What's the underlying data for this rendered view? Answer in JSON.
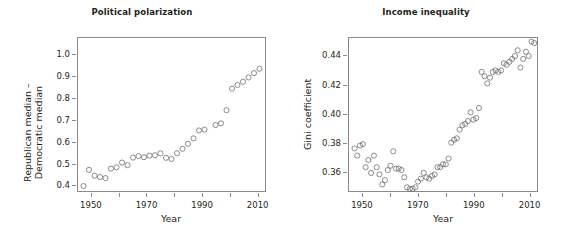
{
  "figure": {
    "background": "#ffffff",
    "point_color": "#6f6f6f",
    "axis_color": "#8a8a8a",
    "text_color": "#231f20"
  },
  "chart_data": [
    {
      "type": "scatter",
      "title": "Political polarization",
      "xlabel": "Year",
      "ylabel": "Republican median –\nDemocratic median",
      "ylabel_line1": "Republican median –",
      "ylabel_line2": "Democratic median",
      "xlim": [
        1945,
        2013
      ],
      "ylim": [
        0.37,
        1.08
      ],
      "xticks": [
        1950,
        1970,
        1990,
        2010
      ],
      "xtick_labels": [
        "1950",
        "1970",
        "1990",
        "2010"
      ],
      "xminor_ticks": [
        1960,
        1980,
        2000
      ],
      "yticks": [
        0.4,
        0.5,
        0.6,
        0.7,
        0.8,
        0.9,
        1.0
      ],
      "ytick_labels": [
        "0.4",
        "0.5",
        "0.6",
        "0.7",
        "0.8",
        "0.9",
        "1.0"
      ],
      "grid": false,
      "legend": null,
      "marker": "open-circle",
      "x": [
        1947,
        1949,
        1951,
        1953,
        1955,
        1957,
        1959,
        1961,
        1963,
        1965,
        1967,
        1969,
        1971,
        1973,
        1975,
        1977,
        1979,
        1981,
        1983,
        1985,
        1987,
        1989,
        1991,
        1995,
        1997,
        1999,
        2001,
        2003,
        2005,
        2007,
        2009,
        2011
      ],
      "y": [
        0.393,
        0.468,
        0.441,
        0.435,
        0.43,
        0.474,
        0.48,
        0.502,
        0.49,
        0.525,
        0.532,
        0.527,
        0.534,
        0.536,
        0.545,
        0.524,
        0.519,
        0.545,
        0.566,
        0.589,
        0.614,
        0.651,
        0.655,
        0.676,
        0.684,
        0.745,
        0.845,
        0.862,
        0.877,
        0.897,
        0.917,
        0.937,
        0.962,
        0.982,
        1.002,
        1.068
      ]
    },
    {
      "type": "scatter",
      "title": "Income inequality",
      "xlabel": "Year",
      "ylabel": "Gini coefficient",
      "xlim": [
        1945,
        2013
      ],
      "ylim": [
        0.3465,
        0.4525
      ],
      "xticks": [
        1950,
        1970,
        1990,
        2010
      ],
      "xtick_labels": [
        "1950",
        "1970",
        "1990",
        "2010"
      ],
      "xminor_ticks": [
        1960,
        1980,
        2000
      ],
      "yticks": [
        0.36,
        0.38,
        0.4,
        0.42,
        0.44
      ],
      "ytick_labels": [
        "0.36",
        "0.38",
        "0.40",
        "0.42",
        "0.44"
      ],
      "grid": false,
      "legend": null,
      "marker": "open-circle",
      "x": [
        1947,
        1948,
        1949,
        1950,
        1951,
        1952,
        1953,
        1954,
        1955,
        1956,
        1957,
        1958,
        1959,
        1960,
        1961,
        1962,
        1963,
        1964,
        1965,
        1966,
        1967,
        1968,
        1969,
        1970,
        1971,
        1972,
        1973,
        1974,
        1975,
        1976,
        1977,
        1978,
        1979,
        1980,
        1981,
        1982,
        1983,
        1984,
        1985,
        1986,
        1987,
        1988,
        1989,
        1990,
        1991,
        1992,
        1993,
        1994,
        1995,
        1996,
        1997,
        1998,
        1999,
        2000,
        2001,
        2002,
        2003,
        2004,
        2005,
        2006,
        2007,
        2008,
        2009,
        2010,
        2011,
        2012
      ],
      "y": [
        0.376,
        0.371,
        0.378,
        0.379,
        0.363,
        0.368,
        0.359,
        0.371,
        0.363,
        0.358,
        0.351,
        0.354,
        0.361,
        0.364,
        0.374,
        0.362,
        0.362,
        0.361,
        0.356,
        0.349,
        0.348,
        0.348,
        0.349,
        0.353,
        0.355,
        0.359,
        0.356,
        0.355,
        0.357,
        0.358,
        0.363,
        0.363,
        0.365,
        0.365,
        0.369,
        0.38,
        0.382,
        0.383,
        0.389,
        0.392,
        0.393,
        0.395,
        0.401,
        0.396,
        0.397,
        0.404,
        0.429,
        0.426,
        0.421,
        0.425,
        0.429,
        0.43,
        0.429,
        0.43,
        0.435,
        0.434,
        0.436,
        0.438,
        0.44,
        0.444,
        0.432,
        0.438,
        0.443,
        0.44,
        0.45,
        0.449
      ]
    }
  ]
}
